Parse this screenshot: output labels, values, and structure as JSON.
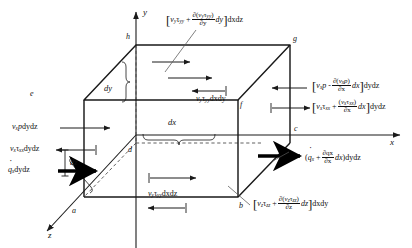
{
  "figure": {
    "type": "control-volume-diagram",
    "axes": {
      "x": "x",
      "y": "y",
      "z": "z"
    },
    "vertices": [
      "a",
      "b",
      "c",
      "d",
      "e",
      "f",
      "g",
      "h"
    ],
    "dimensions": {
      "dx": "dx",
      "dy": "dy",
      "dz": "dz"
    }
  },
  "labels": {
    "top_face": {
      "lead": "v",
      "lead_sub": "y",
      "tau": "τ",
      "tau_sub": "yy",
      "plus": "+",
      "num_open": "∂(",
      "num_v": "v",
      "num_v_sub": "y",
      "num_tau": "τ",
      "num_tau_sub": "yy",
      "num_close": ")",
      "den": "∂y",
      "dterm": "dy",
      "tail": "dxdz"
    },
    "inner_top": {
      "v": "v",
      "v_sub": "y",
      "tau": "τ",
      "tau_sub": "yy",
      "tail": "dxdy"
    },
    "right_pressure": {
      "v": "v",
      "v_sub": "x",
      "p": "p",
      "minus": "-",
      "num_open": "∂(",
      "num_v": "v",
      "num_v_sub": "x",
      "num_p": "p",
      "num_close": ")",
      "den": "∂x",
      "dterm": "dx",
      "tail": "dydz"
    },
    "right_shear": {
      "v": "v",
      "v_sub": "x",
      "tau": "τ",
      "tau_sub": "xx",
      "plus": "+",
      "num_open": "(",
      "num_v": "v",
      "num_v_sub": "x",
      "num_tau": "τ",
      "num_tau_sub": "xx",
      "num_close": ")",
      "den": "∂x",
      "dterm": "dx",
      "tail": "dydz"
    },
    "right_heat": {
      "open": "(",
      "q": "q",
      "q_sub": "x",
      "plus": "+",
      "num": "∂qx",
      "den": "∂x",
      "dterm": "dx",
      "close": ")",
      "tail": "dydz"
    },
    "front_shear": {
      "v": "v",
      "v_sub": "z",
      "tau": "τ",
      "tau_sub": "zz",
      "plus": "+",
      "num_open": "∂(",
      "num_v": "v",
      "num_v_sub": "z",
      "num_tau": "τ",
      "num_tau_sub": "zz",
      "num_close": ")",
      "den": "∂z",
      "dterm": "dz",
      "tail": "dxdy"
    },
    "bottom_face": {
      "v": "v",
      "v_sub": "y",
      "tau": "τ",
      "tau_sub": "yy",
      "tail": "dxdz"
    },
    "left_pressure": {
      "v": "v",
      "v_sub": "x",
      "p": "p",
      "tail": "dydz"
    },
    "left_shear": {
      "v": "v",
      "v_sub": "x",
      "tau": "τ",
      "tau_sub": "xx",
      "tail": "dydz"
    },
    "left_heat": {
      "q": "q",
      "q_sub": "x",
      "tail": "dydz"
    }
  }
}
